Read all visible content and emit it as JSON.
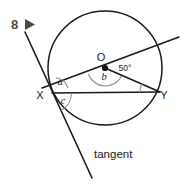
{
  "figure": {
    "question_number": "8",
    "marker_icon": "play-triangle-icon",
    "background_color": "#ffffff",
    "line_color": "#1a1a1a",
    "arc_color": "#8e8e8e",
    "label_color": "#4a4a4a"
  },
  "points": [
    {
      "name": "center",
      "label": "O",
      "x": 105,
      "y": 68,
      "label_x": 101,
      "label_y": 61
    },
    {
      "name": "point-x",
      "label": "X",
      "x": 52,
      "y": 93,
      "label_x": 40,
      "label_y": 99
    },
    {
      "name": "point-y",
      "label": "Y",
      "x": 160,
      "y": 92,
      "label_x": 164,
      "label_y": 99
    }
  ],
  "angles": [
    {
      "name": "angle-a",
      "label": "a",
      "label_x": 60,
      "label_y": 85,
      "vertex": "X",
      "note": "between tangent ray and secant XO"
    },
    {
      "name": "angle-b",
      "label": "b",
      "label_x": 104,
      "label_y": 80,
      "vertex": "O",
      "note": "angle XOY at centre, below secant"
    },
    {
      "name": "angle-c",
      "label": "c",
      "label_x": 63,
      "label_y": 104,
      "vertex": "X",
      "note": "between chord XY and tangent below"
    },
    {
      "name": "angle-50",
      "label": "50°",
      "label_x": 125,
      "label_y": 71,
      "vertex": "Y",
      "note": "angle OYX at Y"
    }
  ],
  "labels": {
    "tangent": "tangent",
    "tangent_x": 94,
    "tangent_y": 158
  },
  "circle": {
    "cx": 105,
    "cy": 68,
    "r": 57
  },
  "lines": [
    {
      "name": "tangent-line",
      "x1": 25,
      "y1": 32,
      "x2": 92,
      "y2": 178
    },
    {
      "name": "secant-line",
      "x1": 42,
      "y1": 88,
      "x2": 179,
      "y2": 37
    },
    {
      "name": "chord-xy",
      "x1": 52,
      "y1": 93,
      "x2": 160,
      "y2": 92
    },
    {
      "name": "radius-oy",
      "x1": 105,
      "y1": 68,
      "x2": 160,
      "y2": 92
    }
  ]
}
